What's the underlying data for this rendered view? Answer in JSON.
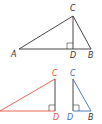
{
  "colors": {
    "black": "#333333",
    "red": "#e8573f",
    "blue": "#3b6fb6",
    "angle_mark": "#e8a3a3"
  },
  "main_triangle": {
    "labels": {
      "A": "A",
      "B": "B",
      "C": "C",
      "D": "D"
    }
  },
  "red_triangle": {
    "labels": {
      "C": "C",
      "D": "D"
    }
  },
  "blue_triangle": {
    "labels": {
      "C": "C",
      "D": "D",
      "B": "B"
    }
  }
}
